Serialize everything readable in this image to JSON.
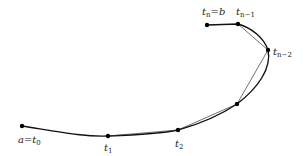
{
  "diagram": {
    "type": "curve-partition",
    "colors": {
      "curve": "#111111",
      "chord": "#333333",
      "point": "#000000",
      "label": "#222222"
    },
    "points": [
      {
        "id": "t0",
        "x": 22,
        "y": 126,
        "label_main": "a=t",
        "label_sub": "0",
        "lx": 20,
        "ly": 141
      },
      {
        "id": "t1",
        "x": 108,
        "y": 136,
        "label_main": "t",
        "label_sub": "1",
        "lx": 104,
        "ly": 150
      },
      {
        "id": "t2",
        "x": 178,
        "y": 130,
        "label_main": "t",
        "label_sub": "2",
        "lx": 175,
        "ly": 146
      },
      {
        "id": "t3",
        "x": 237,
        "y": 104,
        "label_main": "",
        "label_sub": "",
        "lx": 0,
        "ly": 0
      },
      {
        "id": "tn-2",
        "x": 268,
        "y": 50,
        "label_main": "t",
        "label_sub": "n−2",
        "lx": 273,
        "ly": 56
      },
      {
        "id": "tn-1",
        "x": 238,
        "y": 24,
        "label_main": "t",
        "label_sub": "n−1",
        "lx": 236,
        "ly": 14
      },
      {
        "id": "tn",
        "x": 207,
        "y": 25,
        "label_main": "t",
        "label_sub": "n",
        "lx": 202,
        "ly": 14
      }
    ],
    "labels": {
      "t0": {
        "main": "a=t",
        "sub": "0"
      },
      "t1": {
        "main": "t",
        "sub": "1"
      },
      "t2": {
        "main": "t",
        "sub": "2"
      },
      "tn2": {
        "main": "t",
        "sub": "n−2"
      },
      "tn1": {
        "main": "t",
        "sub": "n−1"
      },
      "tn": {
        "main": "t",
        "sub": "n",
        "suffix": "=b"
      }
    }
  }
}
